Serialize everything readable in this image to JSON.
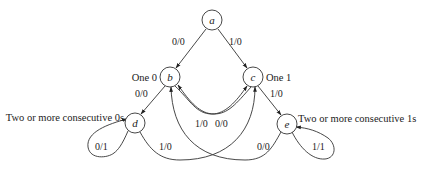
{
  "diagram": {
    "type": "state-diagram",
    "nodes": [
      {
        "id": "a",
        "label": "a",
        "description": "",
        "x": 212,
        "y": 20
      },
      {
        "id": "b",
        "label": "b",
        "description": "One 0",
        "x": 170,
        "y": 77
      },
      {
        "id": "c",
        "label": "c",
        "description": "One 1",
        "x": 253,
        "y": 77
      },
      {
        "id": "d",
        "label": "d",
        "description": "Two or more consecutive 0s",
        "x": 135,
        "y": 123
      },
      {
        "id": "e",
        "label": "e",
        "description": "Two or more consecutive 1s",
        "x": 287,
        "y": 124
      }
    ],
    "edges": [
      {
        "from": "a",
        "to": "b",
        "label": "0/0"
      },
      {
        "from": "a",
        "to": "c",
        "label": "1/0"
      },
      {
        "from": "b",
        "to": "d",
        "label": "0/0"
      },
      {
        "from": "c",
        "to": "e",
        "label": "1/0"
      },
      {
        "from": "b",
        "to": "c",
        "label": "1/0"
      },
      {
        "from": "c",
        "to": "b",
        "label": "0/0"
      },
      {
        "from": "d",
        "to": "d",
        "label": "0/1"
      },
      {
        "from": "d",
        "to": "c",
        "label": "1/0"
      },
      {
        "from": "e",
        "to": "b",
        "label": "0/0"
      },
      {
        "from": "e",
        "to": "e",
        "label": "1/1"
      }
    ]
  }
}
